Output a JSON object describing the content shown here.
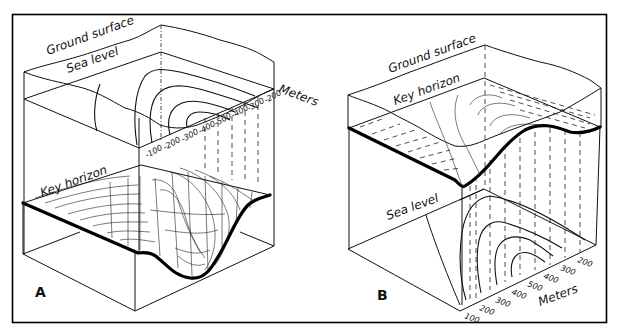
{
  "figure": {
    "frame_color": "#000000",
    "background": "#ffffff",
    "panels": [
      {
        "id": "A",
        "label": "A",
        "ground_surface_label": "Ground surface",
        "sea_level_label": "Sea level",
        "key_horizon_label": "Key horizon",
        "axis_label": "Meters",
        "depth_ticks": [
          "-200",
          "-300",
          "-400",
          "-500",
          "-400",
          "-300",
          "-200",
          "-100"
        ]
      },
      {
        "id": "B",
        "label": "B",
        "ground_surface_label": "Ground surface",
        "key_horizon_label": "Key horizon",
        "sea_level_label": "Sea level",
        "axis_label": "Meters",
        "elevation_ticks": [
          "100",
          "200",
          "300",
          "400",
          "500",
          "400",
          "300",
          "200"
        ]
      }
    ]
  }
}
